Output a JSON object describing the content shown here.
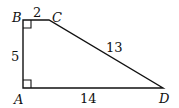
{
  "diagram": {
    "type": "right-trapezoid",
    "vertices": [
      {
        "name": "A",
        "x": 23,
        "y": 88
      },
      {
        "name": "B",
        "x": 23,
        "y": 20
      },
      {
        "name": "C",
        "x": 49,
        "y": 20
      },
      {
        "name": "D",
        "x": 163,
        "y": 88
      }
    ],
    "labels": {
      "A": "A",
      "B": "B",
      "C": "C",
      "D": "D"
    },
    "side_lengths": {
      "BC": "2",
      "CD": "13",
      "AB": "5",
      "AD": "14"
    },
    "right_angles": [
      "B",
      "A"
    ],
    "stroke_color": "#111111"
  }
}
